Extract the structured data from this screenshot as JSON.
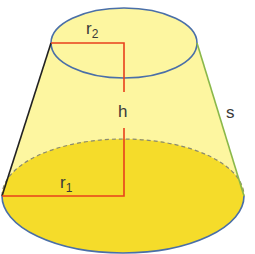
{
  "diagram": {
    "type": "truncated-cone (frustum)",
    "labels": {
      "top_radius": "r",
      "top_radius_sub": "2",
      "bottom_radius": "r",
      "bottom_radius_sub": "1",
      "height": "h",
      "slant": "s"
    },
    "colors": {
      "body_fill": "#fdf6a0",
      "base_fill": "#f5dc2a",
      "ellipse_stroke": "#4a6fa8",
      "measure_line": "#e8401c",
      "slant_line": "#8ab84a",
      "left_edge": "#222222"
    }
  }
}
